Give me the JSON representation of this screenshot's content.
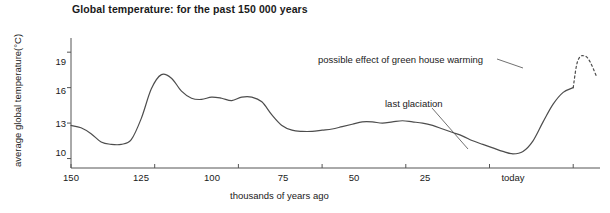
{
  "chart_data": {
    "type": "line",
    "title": "Global temperature: for the past 150 000 years",
    "xlabel": "thousands of years ago",
    "ylabel": "average global temperature(°C)",
    "xlim": [
      150,
      -8
    ],
    "ylim": [
      9.2,
      20.2
    ],
    "x_reversed": true,
    "grid": false,
    "legend": null,
    "xticks": [
      {
        "value": 150,
        "label": "150"
      },
      {
        "value": 125,
        "label": "125"
      },
      {
        "value": 100,
        "label": "100"
      },
      {
        "value": 75,
        "label": "75"
      },
      {
        "value": 50,
        "label": "50"
      },
      {
        "value": 25,
        "label": "25"
      },
      {
        "value": 0,
        "label": "today"
      }
    ],
    "yticks": [
      {
        "value": 10,
        "label": "10"
      },
      {
        "value": 13,
        "label": "13"
      },
      {
        "value": 16,
        "label": "16"
      },
      {
        "value": 19,
        "label": "19"
      }
    ],
    "series": [
      {
        "name": "observed global temperature",
        "style": "solid",
        "color": "#4d4d4d",
        "x": [
          150,
          147,
          144,
          141,
          138,
          135,
          132,
          129,
          126,
          123,
          120,
          117,
          114,
          111,
          108,
          105,
          102,
          99,
          96,
          93,
          90,
          87,
          84,
          81,
          78,
          75,
          72,
          69,
          66,
          63,
          60,
          57,
          54,
          51,
          48,
          45,
          42,
          39,
          36,
          33,
          30,
          27,
          24,
          21,
          18,
          15,
          12,
          9,
          6,
          3,
          0
        ],
        "y": [
          12.8,
          12.6,
          12.1,
          11.4,
          11.2,
          11.2,
          11.6,
          13.4,
          15.9,
          17.1,
          16.8,
          15.7,
          15.1,
          15.0,
          15.2,
          15.1,
          14.9,
          15.2,
          15.2,
          14.8,
          13.7,
          12.8,
          12.4,
          12.3,
          12.3,
          12.4,
          12.5,
          12.7,
          12.9,
          13.1,
          13.1,
          13.0,
          13.1,
          13.2,
          13.1,
          13.0,
          12.8,
          12.5,
          12.2,
          11.9,
          11.5,
          11.2,
          10.9,
          10.6,
          10.4,
          10.6,
          11.5,
          13.1,
          14.6,
          15.6,
          16.0
        ]
      },
      {
        "name": "possible effect of green house warming",
        "style": "dashed",
        "color": "#4d4d4d",
        "x": [
          0,
          -1,
          -2,
          -3,
          -4,
          -5,
          -6,
          -7
        ],
        "y": [
          16.0,
          17.9,
          18.6,
          18.7,
          18.6,
          18.2,
          17.6,
          16.9
        ]
      }
    ],
    "annotations": [
      {
        "id": "greenhouse",
        "text": "possible effect of green house warming",
        "points_to": "dashed-projection-segment"
      },
      {
        "id": "glaciation",
        "text": "last glaciation",
        "points_to": "glacial-minimum-around-18ka"
      }
    ]
  },
  "colors": {
    "line": "#4d4d4d",
    "axis": "#555555",
    "text": "#1a1a1a",
    "background": "#ffffff"
  }
}
